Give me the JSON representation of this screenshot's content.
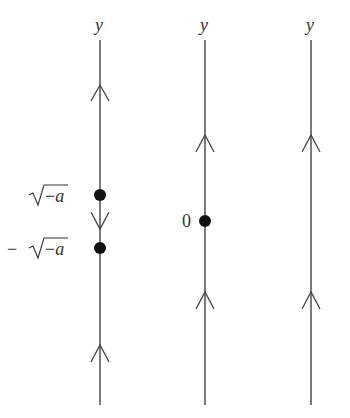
{
  "diagram": {
    "columns": [
      {
        "id": "a-negative",
        "axis_label": "y",
        "x": 100,
        "arrows": [
          {
            "y": 88,
            "direction": "up"
          },
          {
            "y": 227,
            "direction": "down"
          },
          {
            "y": 348,
            "direction": "up"
          }
        ],
        "equilibria": [
          {
            "y": 195,
            "label_prefix": "",
            "label": "√−a"
          },
          {
            "y": 248,
            "label_prefix": "−",
            "label": "√−a"
          }
        ]
      },
      {
        "id": "a-zero",
        "axis_label": "y",
        "x": 205,
        "arrows": [
          {
            "y": 137,
            "direction": "up"
          },
          {
            "y": 294,
            "direction": "up"
          }
        ],
        "equilibria": [
          {
            "y": 221,
            "label": "0"
          }
        ]
      },
      {
        "id": "a-positive",
        "axis_label": "y",
        "x": 311,
        "arrows": [
          {
            "y": 137,
            "direction": "up"
          },
          {
            "y": 294,
            "direction": "up"
          }
        ],
        "equilibria": []
      }
    ],
    "line_top": 40,
    "line_bottom": 405,
    "colors": {
      "line": "#444444",
      "dot": "#111111",
      "text": "#333333"
    }
  }
}
